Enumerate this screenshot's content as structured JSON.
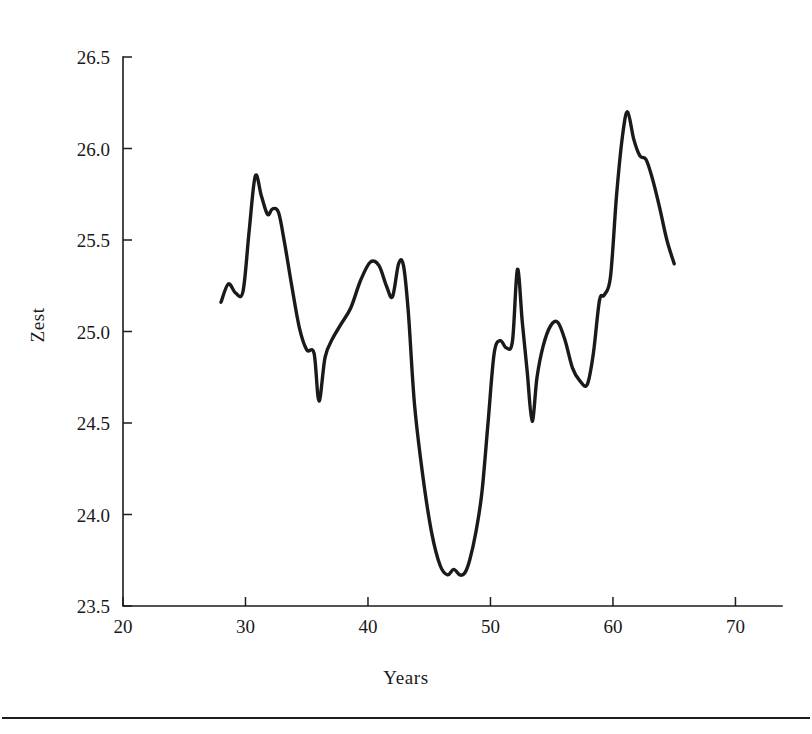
{
  "chart_data": {
    "type": "line",
    "title": "",
    "subtitle": "",
    "xlabel": "Years",
    "ylabel": "Zest",
    "xlim": [
      20,
      73.8
    ],
    "ylim": [
      23.5,
      26.5
    ],
    "xticks": [
      20,
      30,
      40,
      50,
      60,
      70
    ],
    "xtick_labels": [
      "20",
      "30",
      "40",
      "50",
      "60",
      "70"
    ],
    "yticks": [
      23.5,
      24.0,
      24.5,
      25.0,
      25.5,
      26.0,
      26.5
    ],
    "ytick_labels": [
      "23.5",
      "24.0",
      "24.5",
      "25.0",
      "25.5",
      "26.0",
      "26.5"
    ],
    "grid": false,
    "legend": null,
    "legend_position": "none",
    "series": [
      {
        "name": "Zest",
        "color": "#1a1a1a",
        "x": [
          28.0,
          28.6,
          29.2,
          29.8,
          30.3,
          30.8,
          31.3,
          31.8,
          32.2,
          32.7,
          33.2,
          33.8,
          34.4,
          35.0,
          35.6,
          36.0,
          36.5,
          37.1,
          37.8,
          38.6,
          39.4,
          40.2,
          40.9,
          41.5,
          42.0,
          42.5,
          42.9,
          43.3,
          43.8,
          44.5,
          45.2,
          45.9,
          46.5,
          47.0,
          47.5,
          47.9,
          48.3,
          48.8,
          49.3,
          49.8,
          50.3,
          50.8,
          51.3,
          51.8,
          52.2,
          52.6,
          53.0,
          53.4,
          53.8,
          54.3,
          54.9,
          55.5,
          56.1,
          56.7,
          57.3,
          57.9,
          58.4,
          58.9,
          59.3,
          59.8,
          60.3,
          60.8,
          61.2,
          61.7,
          62.2,
          62.7,
          63.2,
          63.8,
          64.4,
          65.0
        ],
        "y": [
          25.16,
          25.26,
          25.21,
          25.22,
          25.55,
          25.85,
          25.74,
          25.64,
          25.67,
          25.65,
          25.48,
          25.24,
          25.02,
          24.9,
          24.88,
          24.62,
          24.86,
          24.96,
          25.04,
          25.13,
          25.28,
          25.38,
          25.36,
          25.25,
          25.19,
          25.37,
          25.36,
          25.1,
          24.6,
          24.2,
          23.9,
          23.72,
          23.67,
          23.7,
          23.67,
          23.68,
          23.75,
          23.9,
          24.12,
          24.5,
          24.88,
          24.95,
          24.91,
          24.95,
          25.34,
          25.05,
          24.78,
          24.51,
          24.75,
          24.92,
          25.03,
          25.05,
          24.95,
          24.8,
          24.73,
          24.71,
          24.88,
          25.17,
          25.2,
          25.3,
          25.75,
          26.08,
          26.2,
          26.05,
          25.96,
          25.94,
          25.84,
          25.68,
          25.5,
          25.37
        ]
      }
    ]
  },
  "figure": {
    "footer_rule_present": true
  }
}
